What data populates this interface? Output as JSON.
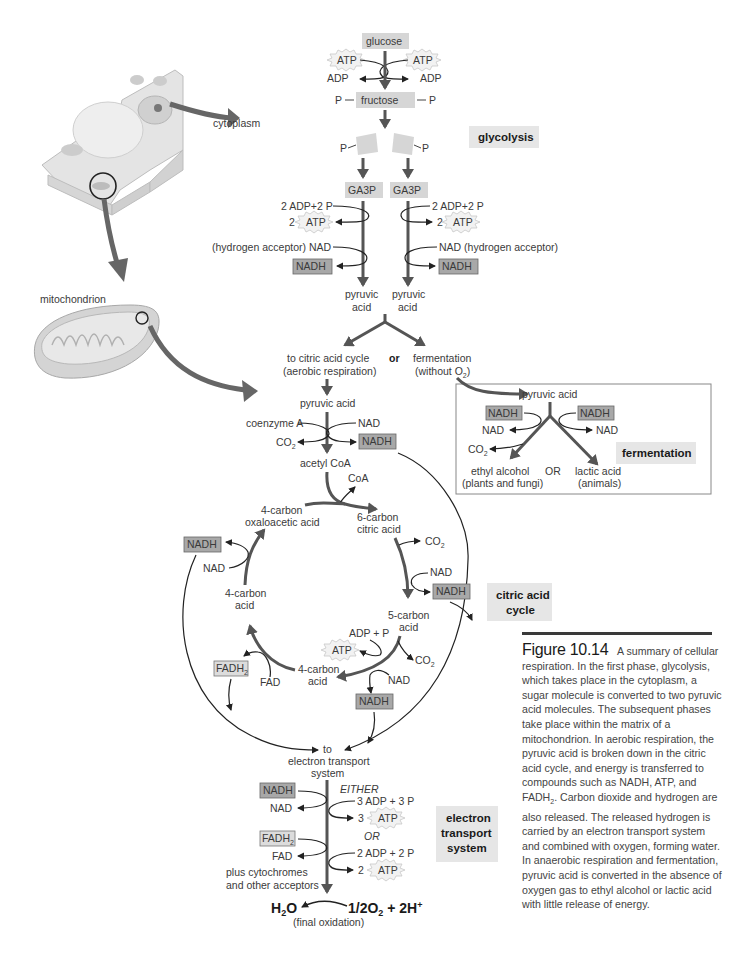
{
  "glycolysis": {
    "glucose": "glucose",
    "atp": "ATP",
    "adp": "ADP",
    "p": "P",
    "fructose": "fructose",
    "ga3p": "GA3P",
    "adp_2p": "2 ADP+2 P",
    "two": "2",
    "nad_left": "(hydrogen  acceptor) NAD",
    "nad_right": "NAD (hydrogen acceptor)",
    "nadh": "NADH",
    "pyruvic": "pyruvic",
    "acid": "acid",
    "section_label": "glycolysis"
  },
  "cell": {
    "cytoplasm_label": "cytoplasm",
    "mitochondrion_label": "mitochondrion"
  },
  "branch": {
    "aerobic_line1": "to citric acid cycle",
    "aerobic_line2": "(aerobic respiration)",
    "or": "or",
    "fermentation_line1": "fermentation",
    "fermentation_line2": "(without O",
    "fermentation_sub": "2",
    "fermentation_close": ")"
  },
  "fermentation": {
    "pyruvic_acid": "pyruvic acid",
    "nadh": "NADH",
    "nad": "NAD",
    "co2": "CO",
    "co2_sub": "2",
    "ethyl_line1": "ethyl alcohol",
    "ethyl_line2": "(plants and fungi)",
    "or": "OR",
    "lactic_line1": "lactic acid",
    "lactic_line2": "(animals)",
    "section_label": "fermentation"
  },
  "citric": {
    "pyruvic_acid": "pyruvic acid",
    "coenzyme_a": "coenzyme A",
    "nad": "NAD",
    "co2": "CO",
    "sub2": "2",
    "nadh": "NADH",
    "acetyl_coa": "acetyl CoA",
    "coa": "CoA",
    "oxalo_line1": "4-carbon",
    "oxalo_line2": "oxaloacetic acid",
    "citric_line1": "6-carbon",
    "citric_line2": "citric acid",
    "c5_line1": "5-carbon",
    "c5_line2": "acid",
    "c4_line1": "4-carbon",
    "c4_line2": "acid",
    "adp_p": "ADP + P",
    "atp": "ATP",
    "fadh": "FADH",
    "fad": "FAD",
    "to_ets_1": "to",
    "to_ets_2": "electron transport",
    "to_ets_3": "system",
    "section_label_1": "citric acid",
    "section_label_2": "cycle"
  },
  "ets": {
    "nadh": "NADH",
    "nad": "NAD",
    "fadh": "FADH",
    "sub2": "2",
    "fad": "FAD",
    "either": "EITHER",
    "adp3": "3 ADP + 3 P",
    "three": "3",
    "atp": "ATP",
    "or": "OR",
    "adp2": "2 ADP + 2 P",
    "two": "2",
    "cyto_line1": "plus cytochromes",
    "cyto_line2": "and other acceptors",
    "h2o": "H",
    "h2o_sub": "2",
    "h2o_o": "O",
    "oxygen": "1/2O",
    "oxygen_sub": "2",
    "oxygen_rest": " + 2H",
    "oxygen_sup": "+",
    "final_ox": "(final oxidation)",
    "section_label_1": "electron",
    "section_label_2": "transport",
    "section_label_3": "system"
  },
  "caption": {
    "figure_label": "Figure 10.14",
    "text": "A summary of cellular respiration. In the first phase, glycolysis, which takes place in the cytoplasm, a sugar molecule is converted to two pyruvic acid molecules. The subsequent phases take place within the matrix of a mitochondrion. In aerobic respiration, the pyruvic acid is broken down in the citric acid cycle, and energy is transferred to compounds such as NADH, ATP, and FADH2. Carbon dioxide and hydrogen are also released. The released hydrogen is carried by an electron transport system and combined with oxygen, forming water. In anaerobic respiration and fermentation, pyruvic acid is converted in the absence of oxygen gas to ethyl alcohol or lactic acid with little release of energy.",
    "text_part1": "A summary of cellular respiration. In the first phase, glycolysis, which takes place in the cytoplasm, a sugar molecule is converted to two pyruvic acid molecules. The subsequent phases take place within the matrix of a mitochondrion. In aerobic respiration, the pyruvic acid is broken down in the citric acid cycle, and energy is transferred to compounds such as NADH, ATP, and FADH",
    "text_sub": "2",
    "text_part2": ". Carbon dioxide and hydrogen are also released. The released hydrogen is carried by an electron transport system and combined with oxygen, forming water. In anaerobic respiration and fermentation, pyruvic acid is converted in the absence of oxygen gas to ethyl alcohol or lactic acid with little release of energy."
  },
  "colors": {
    "thick_arrow": "#555555",
    "label_box": "#e6e6e6",
    "nadh_box": "#a8a8a8",
    "fadh_box": "#dcdcdc",
    "text": "#3a3a3a"
  }
}
